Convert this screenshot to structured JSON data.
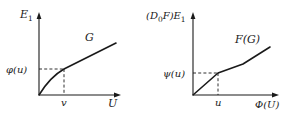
{
  "figure": {
    "panels": [
      {
        "id": "left",
        "y_axis_label": "E",
        "y_axis_label_sub": "1",
        "x_axis_label": "U",
        "curve_label": "G",
        "x_mark_label": "v",
        "y_mark_label": "φ(u)",
        "origin": [
          39,
          95
        ],
        "x_axis_end": 120,
        "y_axis_top": 14,
        "mark_point": [
          64,
          69
        ],
        "curve_points": "M39,95 Q50,78 64,69 L116,43"
      },
      {
        "id": "right",
        "y_axis_label_prefix": "(D",
        "y_axis_label_prefix_sub": "0",
        "y_axis_label_mid": "F)E",
        "y_axis_label_sub": "1",
        "x_axis_label": "Φ(U)",
        "curve_label": "F(G)",
        "x_mark_label": "u",
        "y_mark_label": "ψ(u)",
        "origin": [
          193,
          95
        ],
        "x_axis_end": 282,
        "y_axis_top": 14,
        "mark_point": [
          218,
          73
        ],
        "curve_points": "M193,95 L218,73 L243,64 L270,47"
      }
    ],
    "colors": {
      "ink": "#1a1a1a",
      "background": "#ffffff"
    }
  }
}
